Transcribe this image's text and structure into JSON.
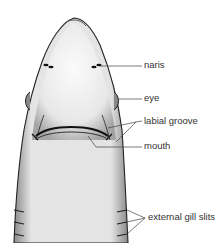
{
  "figure": {
    "labels": {
      "naris": "naris",
      "eye": "eye",
      "labial_groove": "labial groove",
      "mouth": "mouth",
      "gill_slits": "external gill slits"
    }
  }
}
